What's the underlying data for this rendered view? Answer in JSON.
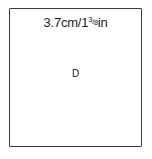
{
  "diagram": {
    "measurement": {
      "metric": "3.7cm/1",
      "fraction_numerator": "3",
      "fraction_slash": "/",
      "fraction_denominator": "8",
      "imperial_unit": "in",
      "full_text": "3.7cm/1 3/8in"
    },
    "center_label": "D",
    "border_color": "#3a3a3a",
    "text_color": "#1a1a1a"
  }
}
